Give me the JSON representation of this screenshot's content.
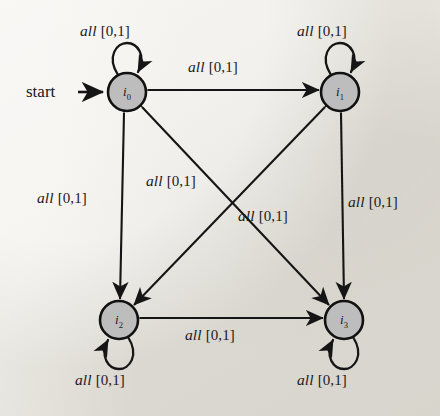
{
  "figure": {
    "kind": "finite-state-machine-diagram",
    "background_color": "#eceae4",
    "ink_color": "#151515",
    "node_fill_color": "#bdbdbd",
    "start_label": "start"
  },
  "states": [
    {
      "id": "i0",
      "label": "i",
      "sub": "0",
      "cx": 127,
      "cy": 92,
      "r": 19
    },
    {
      "id": "i1",
      "label": "i",
      "sub": "1",
      "cx": 340,
      "cy": 92,
      "r": 19
    },
    {
      "id": "i2",
      "label": "i",
      "sub": "2",
      "cx": 119,
      "cy": 320,
      "r": 19
    },
    {
      "id": "i3",
      "label": "i",
      "sub": "3",
      "cx": 344,
      "cy": 320,
      "r": 19
    }
  ],
  "edge_label_text": {
    "symbol": "all",
    "interval": "[0,1]"
  },
  "transitions": [
    {
      "id": "t-self-i0",
      "from": "i0",
      "to": "i0",
      "kind": "self-loop",
      "symbol": "all",
      "interval": "[0,1]"
    },
    {
      "id": "t-self-i1",
      "from": "i1",
      "to": "i1",
      "kind": "self-loop",
      "symbol": "all",
      "interval": "[0,1]"
    },
    {
      "id": "t-self-i2",
      "from": "i2",
      "to": "i2",
      "kind": "self-loop",
      "symbol": "all",
      "interval": "[0,1]"
    },
    {
      "id": "t-self-i3",
      "from": "i3",
      "to": "i3",
      "kind": "self-loop",
      "symbol": "all",
      "interval": "[0,1]"
    },
    {
      "id": "t-i0-i1",
      "from": "i0",
      "to": "i1",
      "kind": "bidirectional",
      "symbol": "all",
      "interval": "[0,1]"
    },
    {
      "id": "t-i2-i3",
      "from": "i2",
      "to": "i3",
      "kind": "bidirectional",
      "symbol": "all",
      "interval": "[0,1]"
    },
    {
      "id": "t-i0-i2",
      "from": "i0",
      "to": "i2",
      "kind": "bidirectional",
      "symbol": "all",
      "interval": "[0,1]"
    },
    {
      "id": "t-i1-i3",
      "from": "i1",
      "to": "i3",
      "kind": "bidirectional",
      "symbol": "all",
      "interval": "[0,1]"
    },
    {
      "id": "t-i0-i3",
      "from": "i0",
      "to": "i3",
      "kind": "bidirectional",
      "symbol": "all",
      "interval": "[0,1]"
    },
    {
      "id": "t-i1-i2",
      "from": "i1",
      "to": "i2",
      "kind": "bidirectional",
      "symbol": "all",
      "interval": "[0,1]"
    }
  ],
  "labels": [
    {
      "id": "lbl-self-i0",
      "symbol": "all",
      "interval": "[0,1]",
      "x": 80,
      "y": 22
    },
    {
      "id": "lbl-self-i1",
      "symbol": "all",
      "interval": "[0,1]",
      "x": 297,
      "y": 22
    },
    {
      "id": "lbl-top",
      "symbol": "all",
      "interval": "[0,1]",
      "x": 188,
      "y": 58
    },
    {
      "id": "lbl-left",
      "symbol": "all",
      "interval": "[0,1]",
      "x": 37,
      "y": 189
    },
    {
      "id": "lbl-right",
      "symbol": "all",
      "interval": "[0,1]",
      "x": 348,
      "y": 193
    },
    {
      "id": "lbl-diag-a",
      "symbol": "all",
      "interval": "[0,1]",
      "x": 146,
      "y": 172
    },
    {
      "id": "lbl-diag-b",
      "symbol": "all",
      "interval": "[0,1]",
      "x": 238,
      "y": 207
    },
    {
      "id": "lbl-bottom",
      "symbol": "all",
      "interval": "[0,1]",
      "x": 185,
      "y": 326
    },
    {
      "id": "lbl-self-i2",
      "symbol": "all",
      "interval": "[0,1]",
      "x": 75,
      "y": 371
    },
    {
      "id": "lbl-self-i3",
      "symbol": "all",
      "interval": "[0,1]",
      "x": 297,
      "y": 371
    }
  ]
}
